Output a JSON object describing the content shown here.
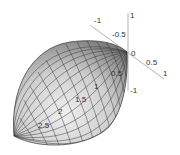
{
  "figure": {
    "type": "3d-surface",
    "colors": {
      "surface_light": "#e8e8e8",
      "surface_dark": "#8a8a8a",
      "mesh": "#333333",
      "axis": "#999999",
      "background": "#ffffff"
    }
  },
  "axes": {
    "vertical": {
      "ticks": [
        "1",
        "-1"
      ]
    },
    "diagonal": {
      "ticks": [
        "-1",
        "-0.5",
        "0",
        "0.5",
        "1"
      ]
    },
    "long_axis": {
      "ticks": [
        "0.5",
        "1",
        "1.5",
        "2",
        "2.5"
      ]
    }
  }
}
